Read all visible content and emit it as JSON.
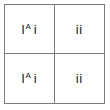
{
  "diagram": {
    "type": "punnett-square",
    "rows": 2,
    "columns": 2,
    "border_color": "#7b7b7b",
    "background_color": "#ffffff",
    "text_color": "#1a1a1a",
    "cells": [
      {
        "position": "top-left",
        "genotype": "IA i",
        "allele_1": "I",
        "allele_1_superscript": "A",
        "allele_2": "i"
      },
      {
        "position": "top-right",
        "genotype": "ii",
        "allele_1": "i",
        "allele_1_superscript": "",
        "allele_2": "i"
      },
      {
        "position": "bottom-left",
        "genotype": "IA i",
        "allele_1": "I",
        "allele_1_superscript": "A",
        "allele_2": "i"
      },
      {
        "position": "bottom-right",
        "genotype": "ii",
        "allele_1": "i",
        "allele_1_superscript": "",
        "allele_2": "i"
      }
    ]
  }
}
